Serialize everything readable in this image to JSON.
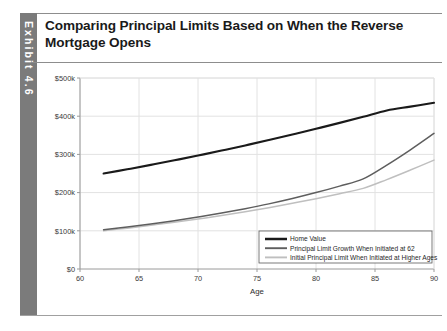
{
  "exhibit": {
    "label": "Exhibit 4.6"
  },
  "title": "Comparing Principal Limits Based on When the Reverse Mortgage Opens",
  "colors": {
    "home_value": "#1a1a1a",
    "principal_limit_growth": "#5e5e5e",
    "initial_principal_limit": "#bfbfbf",
    "grid": "#e2e2e2",
    "axis": "#9a9a9a",
    "exhibit_tab": "#7b7b7b"
  },
  "chart_data": {
    "type": "line",
    "title": "Comparing Principal Limits Based on When the Reverse Mortgage Opens",
    "xlabel": "Age",
    "ylabel": "",
    "xlim": [
      60,
      90
    ],
    "ylim": [
      0,
      500000
    ],
    "xticks": [
      60,
      65,
      70,
      75,
      80,
      85,
      90
    ],
    "xticklabels": [
      "60",
      "65",
      "70",
      "75",
      "80",
      "85",
      "90"
    ],
    "yticks": [
      0,
      100000,
      200000,
      300000,
      400000,
      500000
    ],
    "yticklabels": [
      "$0",
      "$100k",
      "$200k",
      "$300k",
      "$400k",
      "$500k"
    ],
    "grid": true,
    "grid_axis": "both",
    "legend_position": "lower right",
    "x": [
      62,
      64,
      66,
      68,
      70,
      72,
      74,
      76,
      78,
      80,
      82,
      84,
      86,
      88,
      90
    ],
    "series": [
      {
        "name": "Home Value",
        "color": "#1a1a1a",
        "width": 2.1,
        "values": [
          250000,
          261000,
          272500,
          284500,
          297000,
          310000,
          323500,
          337500,
          352000,
          367000,
          382500,
          398500,
          415000,
          425000,
          435000
        ]
      },
      {
        "name": "Principal Limit Growth When Initiated at 62",
        "color": "#5e5e5e",
        "width": 1.5,
        "values": [
          103000,
          110000,
          118000,
          126500,
          136000,
          146500,
          158000,
          170500,
          184500,
          200000,
          217000,
          236000,
          272000,
          312000,
          355000
        ]
      },
      {
        "name": "Initial Principal Limit When Initiated at Higher Ages",
        "color": "#bfbfbf",
        "width": 1.5,
        "values": [
          100000,
          107000,
          114500,
          122500,
          131000,
          140000,
          150000,
          160500,
          172000,
          184000,
          197000,
          211000,
          234000,
          259000,
          285000
        ]
      }
    ]
  }
}
